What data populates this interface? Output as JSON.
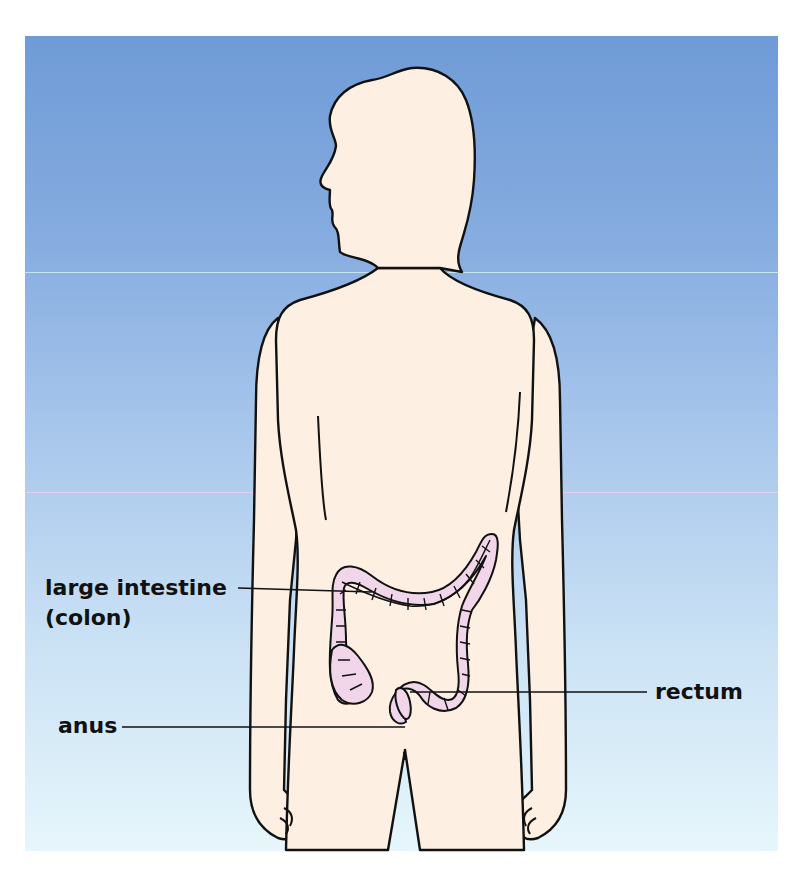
{
  "figure": {
    "type": "anatomical illustration",
    "colors": {
      "background_top": "#6f9bd6",
      "background_bottom": "#e6f6fb",
      "body_fill": "#fdf0e2",
      "colon_fill": "#f1d6ea",
      "outline": "#111111"
    }
  },
  "labels": [
    {
      "id": "large-intestine",
      "line1": "large intestine",
      "line2": "(colon)"
    },
    {
      "id": "anus",
      "text": "anus"
    },
    {
      "id": "rectum",
      "text": "rectum"
    }
  ]
}
